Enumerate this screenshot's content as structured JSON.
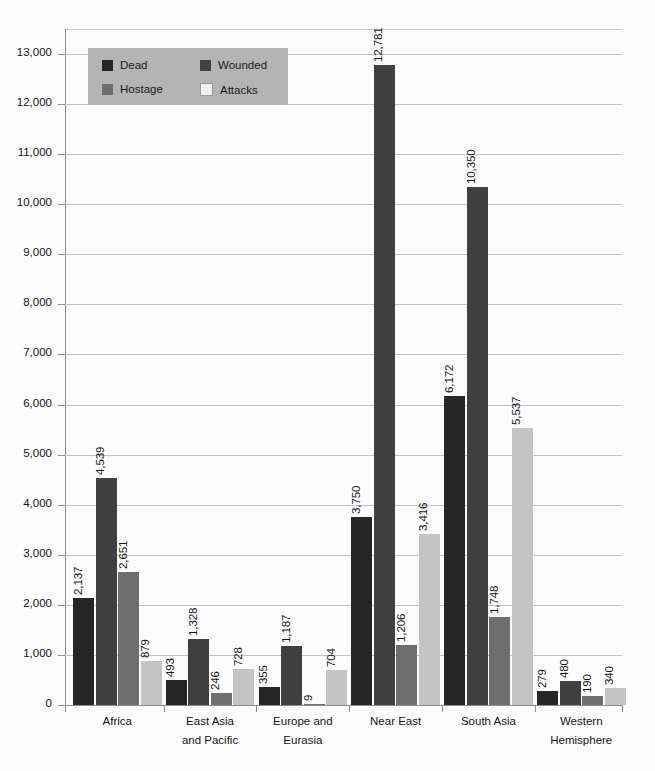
{
  "chart_data": {
    "type": "bar",
    "title": "",
    "subtitle": "",
    "xlabel": "",
    "ylabel": "",
    "ylim": [
      0,
      13500
    ],
    "yticks": [
      0,
      1000,
      2000,
      3000,
      4000,
      5000,
      6000,
      7000,
      8000,
      9000,
      10000,
      11000,
      12000,
      13000
    ],
    "ytick_labels": [
      "0",
      "1,000",
      "2,000",
      "3,000",
      "4,000",
      "5,000",
      "6,000",
      "7,000",
      "8,000",
      "9,000",
      "10,000",
      "11,000",
      "12,000",
      "13,000"
    ],
    "grid": true,
    "grid_axis": "y",
    "legend_position": "top-left",
    "categories": [
      "Africa",
      "East Asia and Pacific",
      "Europe and Eurasia",
      "Near East",
      "South Asia",
      "Western Hemisphere"
    ],
    "category_lines": [
      [
        "Africa"
      ],
      [
        "East Asia",
        "and Pacific"
      ],
      [
        "Europe and",
        "Eurasia"
      ],
      [
        "Near East"
      ],
      [
        "South Asia"
      ],
      [
        "Western",
        "Hemisphere"
      ]
    ],
    "series": [
      {
        "name": "Dead",
        "color": "#262626",
        "values": [
          2137,
          493,
          355,
          3750,
          6172,
          279
        ],
        "labels": [
          "2,137",
          "493",
          "355",
          "3,750",
          "6,172",
          "279"
        ]
      },
      {
        "name": "Wounded",
        "color": "#404040",
        "values": [
          4539,
          1328,
          1187,
          12781,
          10350,
          480
        ],
        "labels": [
          "4,539",
          "1,328",
          "1,187",
          "12,781",
          "10,350",
          "480"
        ]
      },
      {
        "name": "Hostage",
        "color": "#6e6e6e",
        "values": [
          2651,
          246,
          9,
          1206,
          1748,
          190
        ],
        "labels": [
          "2,651",
          "246",
          "9",
          "1,206",
          "1,748",
          "190"
        ]
      },
      {
        "name": "Attacks",
        "color": "#c4c4c4",
        "values": [
          879,
          728,
          704,
          3416,
          5537,
          340
        ],
        "labels": [
          "879",
          "728",
          "704",
          "3,416",
          "5,537",
          "340"
        ]
      }
    ]
  },
  "legend": {
    "background": "#b4b4b4",
    "entries": [
      {
        "label": "Dead",
        "color": "#262626"
      },
      {
        "label": "Wounded",
        "color": "#404040"
      },
      {
        "label": "Hostage",
        "color": "#6e6e6e"
      },
      {
        "label": "Attacks",
        "color": "#f0f0f0"
      }
    ]
  },
  "axes": {
    "axis_color": "#8e8e8e",
    "grid_color": "#c2c2c2",
    "text_color": "#141414"
  },
  "page": {
    "background": "#fcfcfc"
  }
}
